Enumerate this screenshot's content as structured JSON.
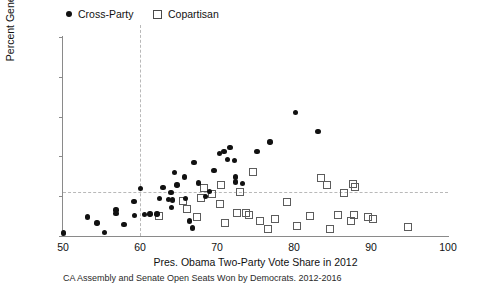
{
  "chart_data": {
    "type": "scatter",
    "title": "",
    "caption": "CA Assembly and Senate Open Seats Won by Democrats. 2012-2016",
    "xlabel": "Pres. Obama Two-Party Vote Share in 2012",
    "ylabel": "Percent General Vote",
    "xlim": [
      50,
      100
    ],
    "ylim": [
      50,
      100
    ],
    "xticks": [
      50,
      60,
      70,
      80,
      90,
      100
    ],
    "yticks": [
      50,
      60,
      70,
      80,
      90,
      100
    ],
    "grid": false,
    "legend_position": "top-left-outside",
    "reference_lines": [
      {
        "axis": "y",
        "value": 61,
        "style": "dashed",
        "color": "#b9b9b9"
      },
      {
        "axis": "x",
        "value": 60,
        "style": "dashed",
        "color": "#b9b9b9"
      }
    ],
    "series": [
      {
        "name": "Cross-Party",
        "marker": "filled-circle",
        "color": "#111111",
        "points": [
          [
            50.1,
            50.8
          ],
          [
            53.2,
            54.8
          ],
          [
            54.4,
            53.3
          ],
          [
            55.4,
            50.9
          ],
          [
            56.9,
            56.5
          ],
          [
            56.9,
            55.6
          ],
          [
            57.9,
            52.9
          ],
          [
            59.2,
            58.6
          ],
          [
            59.3,
            55.2
          ],
          [
            60.1,
            61.9
          ],
          [
            60.6,
            55.4
          ],
          [
            61.3,
            55.5
          ],
          [
            62.2,
            55.5
          ],
          [
            62.5,
            59.4
          ],
          [
            63.0,
            62.2
          ],
          [
            63.7,
            59.1
          ],
          [
            64.0,
            61.0
          ],
          [
            64.1,
            57.2
          ],
          [
            64.2,
            59.0
          ],
          [
            64.5,
            66.0
          ],
          [
            64.8,
            62.8
          ],
          [
            65.8,
            64.8
          ],
          [
            65.9,
            59.4
          ],
          [
            66.4,
            53.8
          ],
          [
            66.8,
            52.0
          ],
          [
            67.0,
            68.5
          ],
          [
            67.6,
            63.3
          ],
          [
            68.5,
            60.0
          ],
          [
            69.0,
            61.2
          ],
          [
            69.6,
            66.4
          ],
          [
            70.3,
            70.7
          ],
          [
            70.9,
            71.2
          ],
          [
            71.4,
            69.2
          ],
          [
            71.7,
            72.2
          ],
          [
            72.3,
            69.0
          ],
          [
            72.4,
            64.8
          ],
          [
            72.4,
            63.6
          ],
          [
            73.3,
            63.2
          ],
          [
            75.2,
            71.3
          ],
          [
            76.9,
            73.6
          ],
          [
            80.2,
            81.0
          ],
          [
            83.1,
            76.3
          ]
        ]
      },
      {
        "name": "Copartisan",
        "marker": "open-square",
        "color": "#5c5c5c",
        "points": [
          [
            62.4,
            55.1
          ],
          [
            65.5,
            59.0
          ],
          [
            66.1,
            57.0
          ],
          [
            67.3,
            55.0
          ],
          [
            67.9,
            59.6
          ],
          [
            68.3,
            62.2
          ],
          [
            69.3,
            60.7
          ],
          [
            70.3,
            58.2
          ],
          [
            70.5,
            63.0
          ],
          [
            71.0,
            53.5
          ],
          [
            72.5,
            56.0
          ],
          [
            72.9,
            61.1
          ],
          [
            73.7,
            56.0
          ],
          [
            74.1,
            55.5
          ],
          [
            74.6,
            66.2
          ],
          [
            75.5,
            53.8
          ],
          [
            76.6,
            52.0
          ],
          [
            77.5,
            54.4
          ],
          [
            79.0,
            58.6
          ],
          [
            80.3,
            52.6
          ],
          [
            82.0,
            55.1
          ],
          [
            83.5,
            64.7
          ],
          [
            84.2,
            63.0
          ],
          [
            84.6,
            51.8
          ],
          [
            85.6,
            55.5
          ],
          [
            86.4,
            61.0
          ],
          [
            87.3,
            53.8
          ],
          [
            87.6,
            63.3
          ],
          [
            87.7,
            55.3
          ],
          [
            87.8,
            62.4
          ],
          [
            89.5,
            54.8
          ],
          [
            90.2,
            54.5
          ],
          [
            94.8,
            52.5
          ]
        ]
      }
    ]
  },
  "legend": {
    "items": [
      {
        "label": "Cross-Party",
        "marker": "filled-circle"
      },
      {
        "label": "Copartisan",
        "marker": "open-square"
      }
    ]
  },
  "axes": {
    "y_title": "Percent General Vote",
    "x_title": "Pres. Obama Two-Party Vote Share in 2012",
    "y_tick_labels": [
      "100",
      "90",
      "80",
      "70",
      "60",
      "50"
    ],
    "x_tick_labels": [
      "50",
      "60",
      "70",
      "80",
      "90",
      "100"
    ]
  },
  "caption": "CA Assembly and Senate Open Seats Won by Democrats. 2012-2016"
}
